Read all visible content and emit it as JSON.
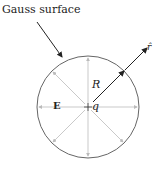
{
  "diagram": {
    "title": "Gauss surface",
    "labels": {
      "radius": "R",
      "field": "E",
      "charge": "q",
      "unit_vector": "r̂"
    },
    "geometry": {
      "center": [
        88,
        107
      ],
      "radius": 51,
      "field_arrow_count": 8
    },
    "colors": {
      "circle": "#666666",
      "field_arrows": "#bbbbbb",
      "arrows": "#222222"
    }
  }
}
